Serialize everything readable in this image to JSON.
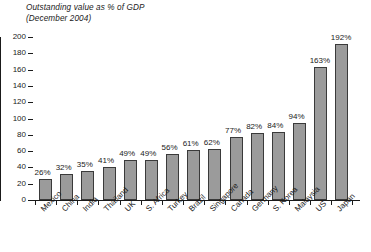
{
  "chart_data": {
    "type": "bar",
    "title": "Outstanding value as % of GDP",
    "subtitle": "(December 2004)",
    "xlabel": "",
    "ylabel": "",
    "ylim": [
      0,
      200
    ],
    "yticks": [
      0,
      20,
      40,
      60,
      80,
      100,
      120,
      140,
      160,
      180,
      200
    ],
    "grid": false,
    "legend": "none",
    "value_suffix": "%",
    "bar_color": "#9b9b9b",
    "bar_edge_color": "#3a3a3a",
    "categories": [
      "Mexico",
      "China",
      "India",
      "Thailand",
      "UK",
      "S. Africa",
      "Turkey",
      "Brazil",
      "Singapore",
      "Canada",
      "Germany",
      "S. Korea",
      "Malaysia",
      "US",
      "Japan"
    ],
    "values": [
      26,
      32,
      35,
      41,
      49,
      49,
      56,
      61,
      62,
      77,
      82,
      84,
      94,
      163,
      192
    ],
    "value_labels": [
      "26%",
      "32%",
      "35%",
      "41%",
      "49%",
      "49%",
      "56%",
      "61%",
      "62%",
      "77%",
      "82%",
      "84%",
      "94%",
      "163%",
      "192%"
    ]
  }
}
